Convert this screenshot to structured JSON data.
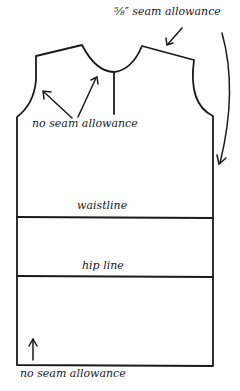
{
  "diagram": {
    "labels": {
      "seam_allowance_top": "⅝″ seam allowance",
      "no_seam_allowance_neck": "no seam allowance",
      "waistline": "waistline",
      "hip_line": "hip line",
      "no_seam_allowance_hem": "no seam allowance"
    },
    "colors": {
      "stroke": "#1a1a1a",
      "background": "#ffffff"
    }
  }
}
